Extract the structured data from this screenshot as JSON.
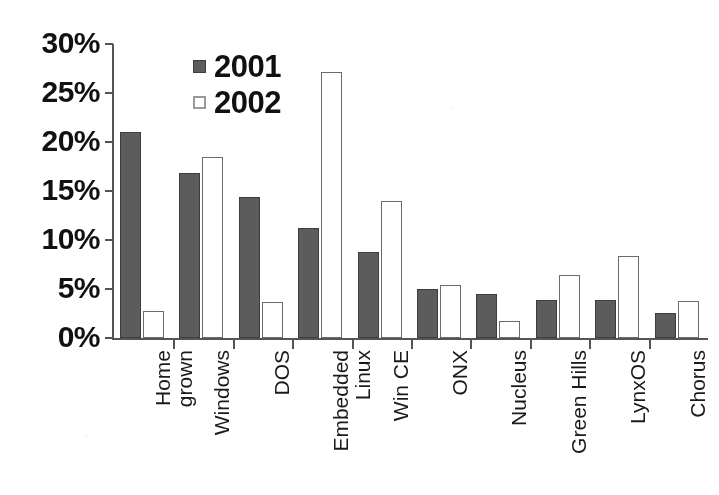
{
  "chart_data": {
    "type": "bar",
    "title": "",
    "subtitle": "",
    "xlabel": "",
    "ylabel": "",
    "ylim": [
      0,
      30
    ],
    "y_tick_values": [
      0,
      5,
      10,
      15,
      20,
      25,
      30
    ],
    "y_tick_labels": [
      "0%",
      "5%",
      "10%",
      "15%",
      "20%",
      "25%",
      "30%"
    ],
    "grid": false,
    "legend_position": "top-center",
    "value_suffix": "%",
    "categories": [
      "Home grown",
      "Windows",
      "DOS",
      "Embedded Linux",
      "Win CE",
      "ONX",
      "Nucleus",
      "Green Hills",
      "LynxOS",
      "Chorus"
    ],
    "category_lines": [
      [
        "Home",
        "grown"
      ],
      [
        "Windows"
      ],
      [
        "DOS"
      ],
      [
        "Embedded",
        "Linux"
      ],
      [
        "Win CE"
      ],
      [
        "ONX"
      ],
      [
        "Nucleus"
      ],
      [
        "Green Hills"
      ],
      [
        "LynxOS"
      ],
      [
        "Chorus"
      ]
    ],
    "series": [
      {
        "name": "2001",
        "color": "#5c5c5c",
        "values": [
          21.0,
          16.8,
          14.4,
          11.2,
          8.8,
          5.0,
          4.5,
          3.9,
          3.9,
          2.6
        ]
      },
      {
        "name": "2002",
        "color": "#ffffff",
        "values": [
          2.8,
          18.5,
          3.7,
          27.1,
          14.0,
          5.4,
          1.7,
          6.4,
          8.4,
          3.8
        ]
      }
    ]
  },
  "legend": {
    "items": [
      {
        "label": "2001",
        "swatch": "filled-dark-square"
      },
      {
        "label": "2002",
        "swatch": "outlined-white-square"
      }
    ]
  },
  "colors": {
    "series_2001": "#5c5c5c",
    "series_2001_border": "#3d3d3d",
    "series_2002": "#ffffff",
    "series_2002_border": "#6b6b6b",
    "axis": "#555555",
    "text": "#111111",
    "background": "#ffffff"
  }
}
